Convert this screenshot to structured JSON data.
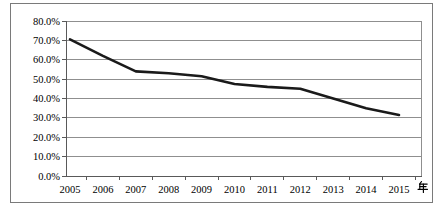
{
  "chart_data": {
    "type": "line",
    "title": "",
    "categories": [
      "2005",
      "2006",
      "2007",
      "2008",
      "2009",
      "2010",
      "2011",
      "2012",
      "2013",
      "2014",
      "2015"
    ],
    "series": [
      {
        "name": "",
        "values": [
          70.5,
          62.0,
          54.0,
          53.0,
          51.5,
          47.5,
          46.0,
          45.0,
          40.0,
          35.0,
          31.5
        ]
      }
    ],
    "x_axis_unit_label": "年",
    "xlabel": "",
    "ylabel": "",
    "ylim": [
      0,
      80
    ],
    "ytick_step": 10,
    "ytick_labels": [
      "0.0%",
      "10.0%",
      "20.0%",
      "30.0%",
      "40.0%",
      "50.0%",
      "60.0%",
      "70.0%",
      "80.0%"
    ],
    "grid": true,
    "legend": "none",
    "colors": {
      "line": "#1a1a1a",
      "gridline": "#8f8f8f",
      "axis": "#595959",
      "tick": "#595959",
      "text": "#000000",
      "frame": "#7a7a7a",
      "background": "#ffffff"
    }
  }
}
